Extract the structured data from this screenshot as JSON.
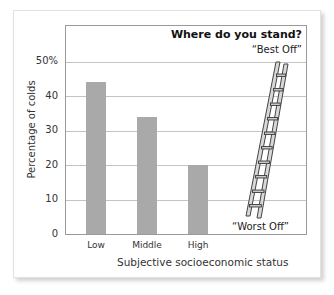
{
  "chart_data": {
    "type": "bar",
    "title": "Where do you stand?",
    "categories": [
      "Low",
      "Middle",
      "High"
    ],
    "values": [
      44,
      34,
      20
    ],
    "xlabel": "Subjective socioeconomic status",
    "ylabel": "Percentage of colds",
    "yticks": [
      "0",
      "10",
      "20",
      "30",
      "40",
      "50%"
    ],
    "ylim": [
      0,
      50
    ],
    "grid": true,
    "bar_color": "#a9a9a9",
    "annotations": {
      "top": "“Best Off”",
      "bottom": "“Worst Off”",
      "illustration": "ladder"
    }
  }
}
